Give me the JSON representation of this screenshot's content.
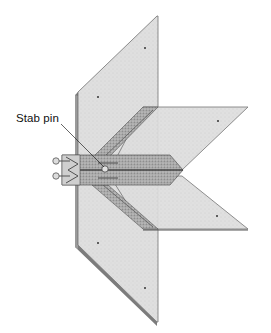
{
  "diagram": {
    "type": "technical-illustration",
    "labels": [
      {
        "id": "stab-pin",
        "text": "Stab pin",
        "x": 16,
        "y": 112,
        "points_to": [
          106,
          170
        ]
      }
    ],
    "colors": {
      "background": "#ffffff",
      "panel_fill": "#d9d9d9",
      "panel_fill_light": "#e4e4e4",
      "panel_edge": "#6a6a6a",
      "channel_dark": "#8a8a8a",
      "channel_mid": "#b5b5b5",
      "pin_fill": "#dcdcdc",
      "text": "#111111"
    }
  }
}
